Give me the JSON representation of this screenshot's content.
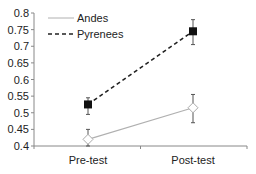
{
  "chart_data": {
    "type": "line",
    "title": "",
    "xlabel": "",
    "ylabel": "",
    "categories": [
      "Pre-test",
      "Post-test"
    ],
    "ylim": [
      0.4,
      0.8
    ],
    "yticks": [
      "0.8",
      "0.75",
      "0.7",
      "0.65",
      "0.6",
      "0.55",
      "0.5",
      "0.45",
      "0.4"
    ],
    "grid": false,
    "legend_position": "upper-left",
    "series": [
      {
        "name": "Andes",
        "style": "solid",
        "color": "#b0b0b0",
        "marker": "open-diamond",
        "values": [
          0.42,
          0.515
        ],
        "error_upper": [
          0.45,
          0.555
        ],
        "error_lower": [
          0.4,
          0.47
        ]
      },
      {
        "name": "Pyrenees",
        "style": "dashed",
        "color": "#222222",
        "marker": "filled-square",
        "values": [
          0.525,
          0.745
        ],
        "error_upper": [
          0.545,
          0.78
        ],
        "error_lower": [
          0.495,
          0.705
        ]
      }
    ]
  },
  "legend": {
    "items": [
      {
        "label": "Andes"
      },
      {
        "label": "Pyrenees"
      }
    ]
  }
}
